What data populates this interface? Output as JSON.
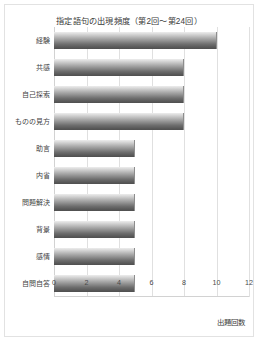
{
  "chart_data": {
    "type": "bar",
    "orientation": "horizontal",
    "title": "指定語句の出現頻度（第2回〜第24回）",
    "xlabel": "出題回数",
    "ylabel": "",
    "categories": [
      "経験",
      "共感",
      "自己探索",
      "ものの見方",
      "助言",
      "内省",
      "問題解決",
      "背景",
      "感情",
      "自問自答"
    ],
    "values": [
      10,
      8,
      8,
      8,
      5,
      5,
      5,
      5,
      5,
      5
    ],
    "xlim": [
      0,
      12
    ],
    "xticks": [
      0,
      2,
      4,
      6,
      8,
      10,
      12
    ],
    "xtick_labels": [
      "0",
      "2",
      "4",
      "6",
      "8",
      "10",
      "12"
    ],
    "grid": true,
    "grid_axis": "x",
    "legend": false,
    "colors": {
      "bar_gradient_top": "#ededed",
      "bar_gradient_bottom": "#4f4f4f",
      "bar_edge": "#8d8d8d",
      "gridline": "#e0e0e0",
      "axis": "#d2d2d2",
      "text": "#3a3a3a",
      "frame": "#e2e2e2",
      "background": "#ffffff"
    }
  }
}
